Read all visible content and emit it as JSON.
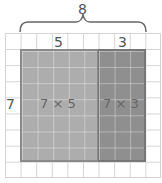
{
  "diagram": {
    "type": "area-model",
    "total_width_label": "8",
    "segment_labels": [
      "5",
      "3"
    ],
    "height_label": "7",
    "regions": [
      {
        "label": "7 × 5",
        "color": "#adadad"
      },
      {
        "label": "7 × 3",
        "color": "#8f8f8f"
      }
    ]
  }
}
